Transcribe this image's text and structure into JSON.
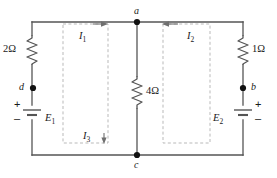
{
  "figure": {
    "type": "circuit-diagram",
    "width": 277,
    "height": 178,
    "line_color": "#555555",
    "loop_color": "#b9b9b9",
    "text_color": "#1a1a1a",
    "background": "#ffffff"
  },
  "nodes": [
    {
      "id": "a",
      "label": "a",
      "x": 137,
      "y": 22
    },
    {
      "id": "b",
      "label": "b",
      "x": 243,
      "y": 88
    },
    {
      "id": "c",
      "label": "c",
      "x": 137,
      "y": 155
    },
    {
      "id": "d",
      "label": "d",
      "x": 33,
      "y": 88
    }
  ],
  "resistors": [
    {
      "id": "r-left",
      "label": "2Ω",
      "value": 2,
      "unit": "Ω",
      "branch": "left"
    },
    {
      "id": "r-center",
      "label": "4Ω",
      "value": 4,
      "unit": "Ω",
      "branch": "center"
    },
    {
      "id": "r-right",
      "label": "1Ω",
      "value": 1,
      "unit": "Ω",
      "branch": "right"
    }
  ],
  "sources": [
    {
      "id": "e1",
      "label": "E",
      "subscript": "1",
      "branch": "left",
      "plus": "+",
      "minus": "–",
      "plus_position": "top",
      "minus_position": "bottom"
    },
    {
      "id": "e2",
      "label": "E",
      "subscript": "2",
      "branch": "right",
      "plus": "+",
      "minus": "–",
      "plus_position": "top",
      "minus_position": "bottom"
    }
  ],
  "loops": [
    {
      "id": "loop1",
      "label": "I",
      "subscript": "1",
      "direction": "clockwise",
      "arrow": "right",
      "x": 63,
      "y": 24,
      "w": 45,
      "h": 119
    },
    {
      "id": "loop2",
      "label": "I",
      "subscript": "2",
      "direction": "counterclockwise",
      "arrow": "left",
      "x": 163,
      "y": 24,
      "w": 47,
      "h": 119
    }
  ],
  "currents": [
    {
      "id": "i3",
      "label": "I",
      "subscript": "3",
      "arrow": "down"
    }
  ]
}
